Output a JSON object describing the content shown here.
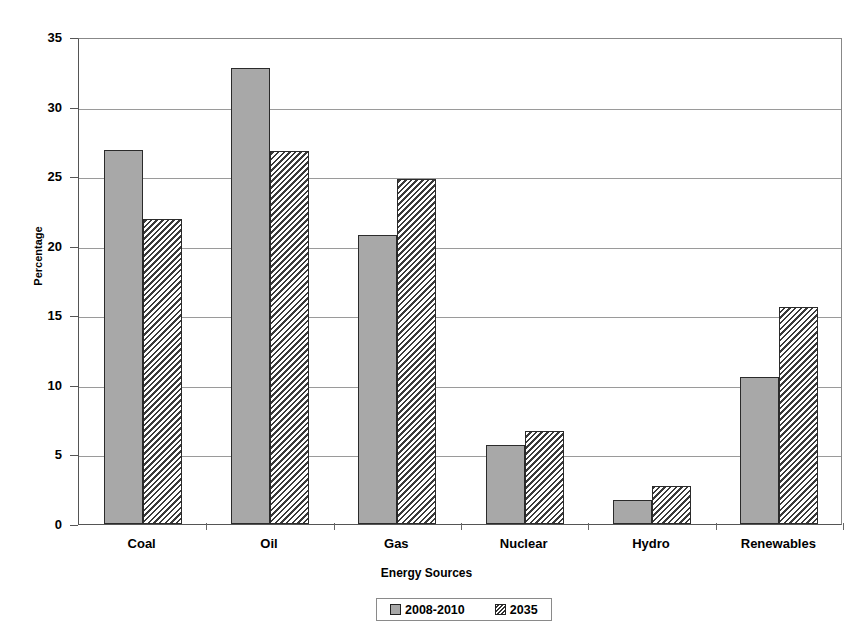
{
  "chart_data": {
    "type": "bar",
    "title": "",
    "xlabel": "Energy Sources",
    "ylabel": "Percentage",
    "categories": [
      "Coal",
      "Oil",
      "Gas",
      "Nuclear",
      "Hydro",
      "Renewables"
    ],
    "series": [
      {
        "name": "2008-2010",
        "pattern": "solid",
        "values": [
          26.9,
          32.8,
          20.8,
          5.7,
          1.7,
          10.6
        ]
      },
      {
        "name": "2035",
        "pattern": "hatch",
        "values": [
          21.9,
          26.8,
          24.8,
          6.7,
          2.7,
          15.6
        ]
      }
    ],
    "ylim": [
      0,
      35
    ],
    "yticks": [
      0,
      5,
      10,
      15,
      20,
      25,
      30,
      35
    ],
    "ytick_labels": [
      "0",
      "5",
      "10",
      "15",
      "20",
      "25",
      "30",
      "35"
    ],
    "grid": true,
    "legend_position": "bottom",
    "colors": {
      "series_1_fill": "#a8a8a8",
      "series_2_fill": "#ffffff",
      "series_2_hatch": "#333333",
      "bar_border": "#2b2b2b",
      "gridline": "#9a9a9a",
      "axis": "#555555",
      "background": "#ffffff"
    }
  }
}
